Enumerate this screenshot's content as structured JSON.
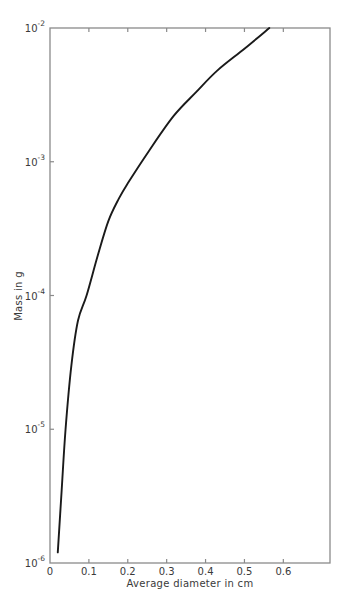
{
  "chart_data": {
    "type": "line",
    "title": "",
    "xlabel": "Average diameter in cm",
    "ylabel": "Mass in g",
    "xscale": "linear",
    "yscale": "log",
    "xlim": [
      0,
      0.72
    ],
    "ylim": [
      1e-06,
      0.01
    ],
    "grid": false,
    "legend": null,
    "x_ticks": [
      0,
      0.1,
      0.2,
      0.3,
      0.4,
      0.5,
      0.6
    ],
    "x_tick_labels": [
      "0",
      "0.1",
      "0.2",
      "0.3",
      "0.4",
      "0.5",
      "0.6"
    ],
    "y_ticks": [
      1e-06,
      1e-05,
      0.0001,
      0.001,
      0.01
    ],
    "y_tick_labels": [
      {
        "base": "10",
        "exp": "-6"
      },
      {
        "base": "10",
        "exp": "-5"
      },
      {
        "base": "10",
        "exp": "-4"
      },
      {
        "base": "10",
        "exp": "-3"
      },
      {
        "base": "10",
        "exp": "-2"
      }
    ],
    "series": [
      {
        "name": "Mass vs average diameter",
        "color": "#1a1a1a",
        "x": [
          0.02,
          0.03,
          0.04,
          0.055,
          0.072,
          0.094,
          0.123,
          0.15,
          0.177,
          0.2,
          0.254,
          0.318,
          0.375,
          0.43,
          0.5,
          0.564
        ],
        "y": [
          1.2e-06,
          3.5e-06,
          1e-05,
          3e-05,
          6.5e-05,
          0.0001,
          0.0002,
          0.00036,
          0.00053,
          0.00069,
          0.0012,
          0.0022,
          0.0033,
          0.0048,
          0.007,
          0.01
        ]
      }
    ]
  },
  "colors": {
    "axis": "#8a8a8a",
    "curve": "#1a1a1a",
    "text": "#3a3a3a",
    "background": "#ffffff"
  }
}
